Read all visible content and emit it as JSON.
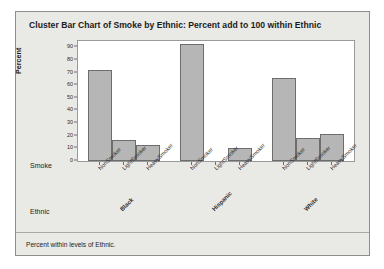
{
  "chart_data": {
    "type": "bar",
    "title": "Cluster Bar Chart of Smoke by Ethnic: Percent add to 100 within Ethnic",
    "xlabel": "Smoke",
    "ylabel": "Percent",
    "group_axis_label": "Ethnic",
    "footnote": "Percent within levels of Ethnic.",
    "ylim": [
      0,
      95
    ],
    "yticks": [
      0,
      10,
      20,
      30,
      40,
      50,
      60,
      70,
      80,
      90
    ],
    "grid": false,
    "legend": "none",
    "categories": [
      "NonSmoker",
      "LightSmoker",
      "HeavySmoker"
    ],
    "groups": [
      "Black",
      "Hispanic",
      "White"
    ],
    "series": [
      {
        "name": "Black",
        "values": [
          72,
          16.5,
          13
        ]
      },
      {
        "name": "Hispanic",
        "values": [
          93,
          0,
          10
        ]
      },
      {
        "name": "White",
        "values": [
          66,
          18,
          21.5
        ]
      }
    ],
    "bar_color": "#b6b6b6",
    "bar_border_color": "#6d6d6d",
    "plot_background": "#ffffff",
    "panel_background": "#e9e9e6"
  }
}
